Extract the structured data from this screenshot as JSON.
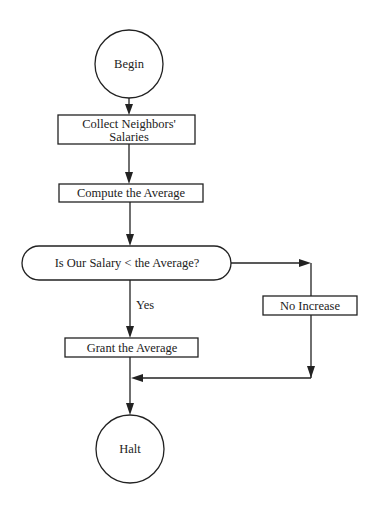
{
  "flowchart": {
    "nodes": {
      "begin": {
        "type": "terminal",
        "label": "Begin"
      },
      "collect": {
        "type": "process",
        "line1": "Collect Neighbors'",
        "line2": "Salaries"
      },
      "compute": {
        "type": "process",
        "label": "Compute the Average"
      },
      "decision": {
        "type": "decision",
        "label": "Is Our Salary < the Average?"
      },
      "no_increase": {
        "type": "process",
        "label": "No Increase"
      },
      "grant": {
        "type": "process",
        "label": "Grant the Average"
      },
      "halt": {
        "type": "terminal",
        "label": "Halt"
      }
    },
    "edge_labels": {
      "yes": "Yes"
    },
    "edges": [
      {
        "from": "begin",
        "to": "collect"
      },
      {
        "from": "collect",
        "to": "compute"
      },
      {
        "from": "compute",
        "to": "decision"
      },
      {
        "from": "decision",
        "to": "grant",
        "label": "Yes"
      },
      {
        "from": "decision",
        "to": "no_increase"
      },
      {
        "from": "no_increase",
        "to": "merge"
      },
      {
        "from": "grant",
        "to": "halt"
      }
    ]
  }
}
